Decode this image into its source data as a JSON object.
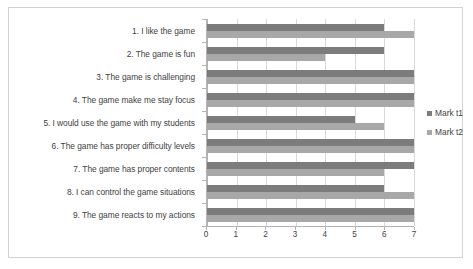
{
  "chart_data": {
    "type": "bar",
    "orientation": "horizontal",
    "title": "",
    "xlabel": "",
    "ylabel": "",
    "xlim": [
      0,
      7
    ],
    "xticks": [
      0,
      1,
      2,
      3,
      4,
      5,
      6,
      7
    ],
    "grid": true,
    "legend_position": "right",
    "categories": [
      "1. I like the game",
      "2. The game is fun",
      "3. The game is challenging",
      "4. The game make me stay focus",
      "5. I would use the game with my students",
      "6. The game has proper difficulty levels",
      "7. The game has proper contents",
      "8. I can control the game situations",
      "9. The game reacts to my actions"
    ],
    "series": [
      {
        "name": "Mark t1",
        "color": "#7c7c7c",
        "values": [
          6,
          6,
          7,
          7,
          5,
          7,
          7,
          6,
          7
        ]
      },
      {
        "name": "Mark t2",
        "color": "#a8a8a8",
        "values": [
          7,
          4,
          7,
          7,
          6,
          7,
          6,
          7,
          7
        ]
      }
    ]
  },
  "colors": {
    "series_t1": "#7c7c7c",
    "series_t2": "#a8a8a8",
    "axis": "#b4b4b4",
    "gridline": "#d9d9d9",
    "text": "#3f3f3f",
    "border": "#d2d2d2",
    "background": "#ffffff"
  }
}
